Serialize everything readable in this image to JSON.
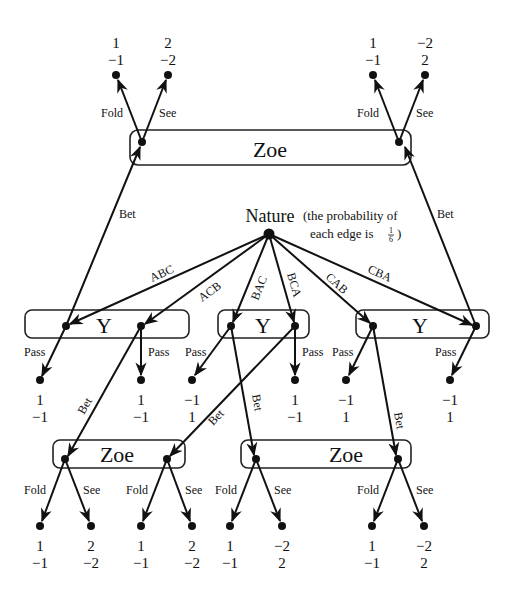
{
  "nature": {
    "label": "Nature",
    "note_line1": "(the probability of",
    "note_line2": "each edge is",
    "note_frac_num": "1",
    "note_frac_den": "6",
    "note_close": ")"
  },
  "info_sets": {
    "zoe_top": "Zoe",
    "y_left": "Y",
    "y_mid": "Y",
    "y_right": "Y",
    "zoe_bottom_left": "Zoe",
    "zoe_bottom_right": "Zoe"
  },
  "nature_edges": [
    "ABC",
    "ACB",
    "BAC",
    "BCA",
    "CAB",
    "CBA"
  ],
  "actions": {
    "fold": "Fold",
    "see": "See",
    "pass": "Pass",
    "bet": "Bet"
  },
  "top_payoffs": [
    {
      "p1": "1",
      "p2": "−1"
    },
    {
      "p1": "2",
      "p2": "−2"
    },
    {
      "p1": "1",
      "p2": "−1"
    },
    {
      "p1": "−2",
      "p2": "2"
    }
  ],
  "pass_payoffs": [
    {
      "p1": "1",
      "p2": "−1"
    },
    {
      "p1": "1",
      "p2": "−1"
    },
    {
      "p1": "−1",
      "p2": "1"
    },
    {
      "p1": "1",
      "p2": "−1"
    },
    {
      "p1": "−1",
      "p2": "1"
    },
    {
      "p1": "−1",
      "p2": "1"
    }
  ],
  "bottom_payoffs": [
    {
      "p1": "1",
      "p2": "−1"
    },
    {
      "p1": "2",
      "p2": "−2"
    },
    {
      "p1": "1",
      "p2": "−1"
    },
    {
      "p1": "2",
      "p2": "−2"
    },
    {
      "p1": "1",
      "p2": "−1"
    },
    {
      "p1": "−2",
      "p2": "2"
    },
    {
      "p1": "1",
      "p2": "−1"
    },
    {
      "p1": "−2",
      "p2": "2"
    }
  ]
}
